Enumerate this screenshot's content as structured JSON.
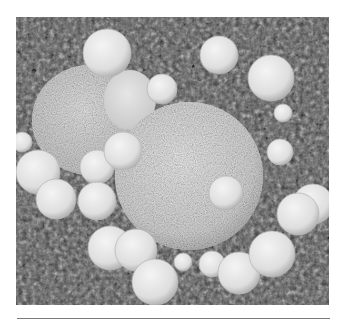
{
  "figure": {
    "kind": "grayscale SEM micrograph",
    "colors": {
      "background_dark": "#2e2e2e",
      "background_mid": "#6a6a6a",
      "background_light": "#9a9a9a",
      "main_sphere": "#dcdcdc",
      "lumpy_mass": "#d2d2d2",
      "small_sphere": "#e2e2e2",
      "small_sphere_edge": "#b8b8b8",
      "rule": "#7a7a7a"
    },
    "main_sphere": {
      "cx": 189,
      "cy": 176,
      "r": 74
    },
    "lumpy_mass": {
      "cx": 90,
      "cy": 120,
      "rx": 58,
      "ry": 55
    },
    "small_spheres": [
      {
        "cx": 107,
        "cy": 53,
        "r": 24
      },
      {
        "cx": 219,
        "cy": 55,
        "r": 19
      },
      {
        "cx": 271,
        "cy": 78,
        "r": 23
      },
      {
        "cx": 162,
        "cy": 89,
        "r": 15
      },
      {
        "cx": 283,
        "cy": 113,
        "r": 9
      },
      {
        "cx": 22,
        "cy": 142,
        "r": 10
      },
      {
        "cx": 38,
        "cy": 172,
        "r": 22
      },
      {
        "cx": 97,
        "cy": 167,
        "r": 17
      },
      {
        "cx": 123,
        "cy": 151,
        "r": 19
      },
      {
        "cx": 280,
        "cy": 152,
        "r": 13
      },
      {
        "cx": 56,
        "cy": 199,
        "r": 20
      },
      {
        "cx": 97,
        "cy": 201,
        "r": 19
      },
      {
        "cx": 226,
        "cy": 193,
        "r": 17
      },
      {
        "cx": 313,
        "cy": 204,
        "r": 20
      },
      {
        "cx": 298,
        "cy": 214,
        "r": 21
      },
      {
        "cx": 110,
        "cy": 248,
        "r": 22
      },
      {
        "cx": 136,
        "cy": 250,
        "r": 21
      },
      {
        "cx": 183,
        "cy": 262,
        "r": 9
      },
      {
        "cx": 212,
        "cy": 264,
        "r": 13
      },
      {
        "cx": 239,
        "cy": 273,
        "r": 21
      },
      {
        "cx": 272,
        "cy": 254,
        "r": 23
      },
      {
        "cx": 155,
        "cy": 282,
        "r": 23
      }
    ]
  }
}
